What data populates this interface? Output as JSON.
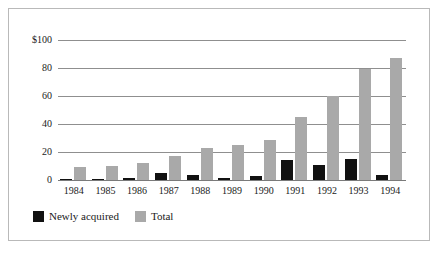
{
  "chart_data": {
    "type": "bar",
    "title": "",
    "subtitle": "",
    "xlabel": "",
    "ylabel": "",
    "categories": [
      "1984",
      "1985",
      "1986",
      "1987",
      "1988",
      "1989",
      "1990",
      "1991",
      "1992",
      "1993",
      "1994"
    ],
    "series": [
      {
        "name": "Newly acquired",
        "color": "#111111",
        "values": [
          0.5,
          1,
          1.5,
          5,
          3.5,
          1.5,
          3,
          14,
          11,
          15,
          3.5
        ]
      },
      {
        "name": "Total",
        "color": "#a9a9a9",
        "values": [
          9,
          10,
          12,
          17,
          23,
          25,
          28.5,
          45,
          60,
          79,
          87.5
        ]
      }
    ],
    "ylim": [
      0,
      100
    ],
    "yticks": [
      0,
      20,
      40,
      60,
      80,
      100
    ],
    "ytick_labels": [
      "0",
      "20",
      "40",
      "60",
      "80",
      "$100"
    ],
    "grid": true,
    "legend_position": "bottom-left"
  },
  "legend": {
    "entries": [
      {
        "label": "Newly acquired",
        "color": "#111111"
      },
      {
        "label": "Total",
        "color": "#a9a9a9"
      }
    ]
  },
  "frame": {
    "border_color": "#b9b9b9",
    "background": "#ffffff"
  }
}
